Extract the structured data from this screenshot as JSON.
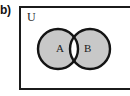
{
  "figure": {
    "part_label": "b)",
    "universe_label": "U",
    "diagram_type": "venn-diagram",
    "caption": ""
  },
  "sets": [
    {
      "id": "A",
      "label": "A",
      "shaded": true
    },
    {
      "id": "B",
      "label": "B",
      "shaded": true
    }
  ],
  "regions": [
    {
      "name": "A-only",
      "shaded": true,
      "fill": "#c8c8c8"
    },
    {
      "name": "A-intersect-B",
      "shaded": false,
      "fill": "#ffffff"
    },
    {
      "name": "B-only",
      "shaded": true,
      "fill": "#c8c8c8"
    },
    {
      "name": "outside",
      "shaded": false,
      "fill": "#ffffff"
    }
  ],
  "colors": {
    "shade": "#c8c8c8",
    "outline": "#141414",
    "box_border": "#1b1b1b",
    "background": "#ffffff",
    "text": "#1b1b1b"
  }
}
